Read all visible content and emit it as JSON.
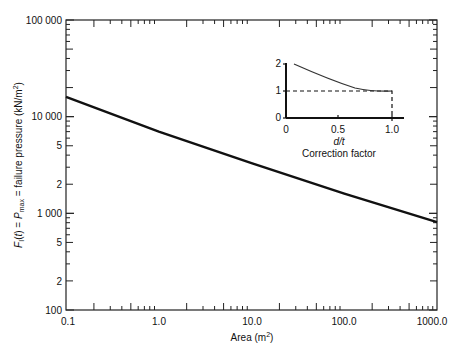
{
  "chart_data": [
    {
      "type": "line",
      "title": "",
      "xlabel": "Area (m²)",
      "ylabel": "F_I(t) = P_max = failure pressure (kN/m²)",
      "x_scale": "log",
      "y_scale": "log",
      "xlim": [
        0.1,
        1000.0
      ],
      "ylim": [
        100,
        100000
      ],
      "x_tick_labels": [
        "0.1",
        "1.0",
        "10.0",
        "100.0",
        "1000.0"
      ],
      "y_tick_labels": [
        "100",
        "2",
        "5",
        "1 000",
        "2",
        "5",
        "10 000",
        "5",
        "100 000"
      ],
      "grid": false,
      "legend": null,
      "series": [
        {
          "name": "failure pressure",
          "x": [
            0.1,
            1.0,
            10.0,
            100.0,
            1000.0
          ],
          "y": [
            16000,
            7000,
            3300,
            1600,
            810
          ]
        }
      ]
    },
    {
      "type": "line",
      "title": "Correction factor",
      "xlabel": "d/t",
      "ylabel": "",
      "xlim": [
        0,
        1.1
      ],
      "ylim": [
        0,
        2.2
      ],
      "x_tick_labels": [
        "0",
        "0.5",
        "1.0"
      ],
      "y_tick_labels": [
        "0",
        "1",
        "2"
      ],
      "grid": false,
      "series": [
        {
          "name": "correction curve",
          "x": [
            0.08,
            0.2,
            0.4,
            0.6,
            0.8,
            1.0
          ],
          "y": [
            2.0,
            1.75,
            1.4,
            1.15,
            1.02,
            1.0
          ]
        },
        {
          "name": "reference (dashed)",
          "x": [
            0,
            1.0,
            1.0
          ],
          "y": [
            1.0,
            1.0,
            0
          ]
        }
      ]
    }
  ],
  "labels": {
    "xlabel": "Area (m",
    "xlabel_sup": "2",
    "xlabel_end": ")",
    "ylabel": "F",
    "x_ticks": [
      "0.1",
      "1.0",
      "10.0",
      "100.0",
      "1000.0"
    ],
    "y_ticks": [
      {
        "label": "100 000",
        "y": 20
      },
      {
        "label": "10 000",
        "y": 116
      },
      {
        "label": "5",
        "y": 145
      },
      {
        "label": "2",
        "y": 184
      },
      {
        "label": "1 000",
        "y": 213
      },
      {
        "label": "5",
        "y": 242
      },
      {
        "label": "2",
        "y": 281
      },
      {
        "label": "100",
        "y": 310
      }
    ],
    "inset_x_ticks": [
      "0",
      "0.5",
      "1.0"
    ],
    "inset_y_ticks": [
      "0",
      "1",
      "2"
    ],
    "inset_xlabel": "d/t",
    "inset_title": "Correction factor"
  }
}
